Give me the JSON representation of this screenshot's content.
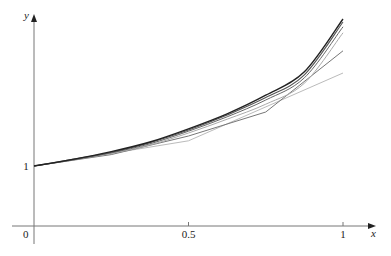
{
  "chart_data": {
    "type": "line",
    "title": "",
    "xlabel": "x",
    "ylabel": "y",
    "xlim": [
      0,
      1.12
    ],
    "ylim": [
      0,
      3.5
    ],
    "grid": false,
    "legend": "none",
    "x_ticks": [
      {
        "value": 0.5,
        "label": "0.5"
      },
      {
        "value": 1,
        "label": "1"
      }
    ],
    "y_ticks": [
      {
        "value": 1,
        "label": "1"
      }
    ],
    "origin_label": "0",
    "series": [
      {
        "name": "curve-1-exact",
        "color": "#222222",
        "width": 1.4,
        "x": [
          0,
          0.125,
          0.25,
          0.375,
          0.5,
          0.625,
          0.75,
          0.875,
          1
        ],
        "y": [
          1,
          1.11,
          1.24,
          1.4,
          1.62,
          1.87,
          2.18,
          2.57,
          3.45
        ]
      },
      {
        "name": "curve-2",
        "color": "#555555",
        "width": 1.1,
        "x": [
          0,
          0.125,
          0.25,
          0.375,
          0.5,
          0.625,
          0.75,
          0.875,
          1
        ],
        "y": [
          1,
          1.11,
          1.23,
          1.39,
          1.6,
          1.85,
          2.14,
          2.52,
          3.4
        ]
      },
      {
        "name": "curve-3",
        "color": "#666666",
        "width": 1.0,
        "x": [
          0,
          0.125,
          0.25,
          0.375,
          0.5,
          0.625,
          0.75,
          0.875,
          1
        ],
        "y": [
          1,
          1.1,
          1.22,
          1.37,
          1.58,
          1.82,
          2.1,
          2.47,
          3.32
        ]
      },
      {
        "name": "curve-4",
        "color": "#aaaaaa",
        "width": 1.0,
        "x": [
          0,
          0.125,
          0.25,
          0.375,
          0.5,
          0.625,
          0.75,
          0.875,
          1
        ],
        "y": [
          1,
          1.1,
          1.21,
          1.35,
          1.55,
          1.78,
          2.03,
          2.38,
          3.22
        ]
      },
      {
        "name": "curve-5",
        "color": "#777777",
        "width": 1.0,
        "x": [
          0,
          0.25,
          0.5,
          0.75,
          1
        ],
        "y": [
          1,
          1.19,
          1.5,
          1.9,
          2.92
        ]
      },
      {
        "name": "curve-6",
        "color": "#bbbbbb",
        "width": 1.0,
        "x": [
          0,
          0.5,
          1
        ],
        "y": [
          1,
          1.42,
          2.55
        ]
      }
    ]
  }
}
